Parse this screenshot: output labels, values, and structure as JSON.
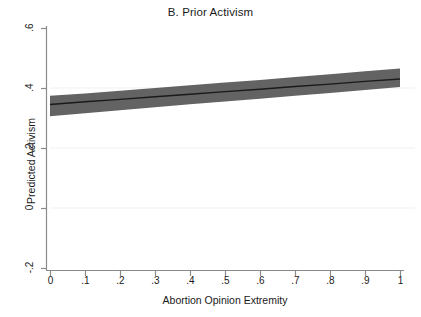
{
  "chart_data": {
    "type": "area",
    "title": "B. Prior Activism",
    "xlabel": "Abortion Opinion Extremity",
    "ylabel": "Predicted Activism",
    "xlim": [
      0,
      1
    ],
    "ylim": [
      -0.2,
      0.6
    ],
    "xticks": [
      0,
      0.1,
      0.2,
      0.3,
      0.4,
      0.5,
      0.6,
      0.7,
      0.8,
      0.9,
      1
    ],
    "xtick_labels": [
      "0",
      ".1",
      ".2",
      ".3",
      ".4",
      ".5",
      ".6",
      ".7",
      ".8",
      ".9",
      "1"
    ],
    "yticks": [
      -0.2,
      0,
      0.2,
      0.4,
      0.6
    ],
    "ytick_labels": [
      "-.2",
      "0",
      ".2",
      ".4",
      ".6"
    ],
    "grid": true,
    "gridlines_y": [
      0,
      0.2,
      0.4
    ],
    "legend": null,
    "band_color": "#636363",
    "line_color": "#1a1a1a",
    "grid_color": "#f0f0f0",
    "axis_color": "#808080",
    "series": [
      {
        "name": "Predicted Activism",
        "type": "line",
        "x": [
          0,
          0.1,
          0.2,
          0.3,
          0.4,
          0.5,
          0.6,
          0.7,
          0.8,
          0.9,
          1
        ],
        "values": [
          0.345,
          0.354,
          0.362,
          0.371,
          0.379,
          0.388,
          0.396,
          0.405,
          0.413,
          0.422,
          0.43
        ]
      },
      {
        "name": "95% Confidence Interval Upper",
        "type": "band-upper",
        "x": [
          0,
          0.1,
          0.2,
          0.3,
          0.4,
          0.5,
          0.6,
          0.7,
          0.8,
          0.9,
          1
        ],
        "values": [
          0.374,
          0.382,
          0.391,
          0.4,
          0.409,
          0.418,
          0.427,
          0.437,
          0.446,
          0.456,
          0.465
        ]
      },
      {
        "name": "95% Confidence Interval Lower",
        "type": "band-lower",
        "x": [
          0,
          0.1,
          0.2,
          0.3,
          0.4,
          0.5,
          0.6,
          0.7,
          0.8,
          0.9,
          1
        ],
        "values": [
          0.306,
          0.316,
          0.326,
          0.336,
          0.346,
          0.355,
          0.364,
          0.374,
          0.383,
          0.393,
          0.403
        ]
      }
    ]
  }
}
